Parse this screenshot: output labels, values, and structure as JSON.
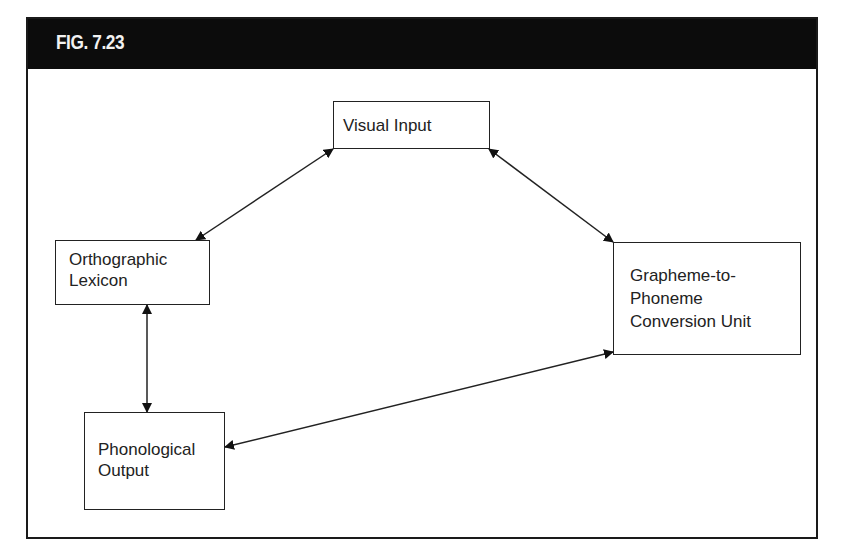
{
  "figure": {
    "title": "FIG. 7.23",
    "colors": {
      "header_background": "#0c0c0c",
      "header_text": "#f2f2f2",
      "border": "#222222",
      "background": "#ffffff"
    }
  },
  "nodes": [
    {
      "id": "visual-input",
      "label": "Visual Input"
    },
    {
      "id": "orthographic-lexicon",
      "label": "Orthographic\nLexicon"
    },
    {
      "id": "grapheme-to-phoneme",
      "label": "Grapheme-to-\nPhoneme\nConversion Unit"
    },
    {
      "id": "phonological-output",
      "label": "Phonological\nOutput"
    }
  ],
  "edges": [
    {
      "from": "visual-input",
      "to": "orthographic-lexicon",
      "direction": "bidirectional"
    },
    {
      "from": "visual-input",
      "to": "grapheme-to-phoneme",
      "direction": "bidirectional"
    },
    {
      "from": "orthographic-lexicon",
      "to": "phonological-output",
      "direction": "bidirectional"
    },
    {
      "from": "grapheme-to-phoneme",
      "to": "phonological-output",
      "direction": "bidirectional"
    }
  ]
}
